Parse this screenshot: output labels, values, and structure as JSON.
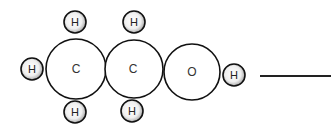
{
  "diagram": {
    "molecule": "ethanol space-filling model",
    "atoms": [
      {
        "id": "h-left",
        "element": "H",
        "label": "H"
      },
      {
        "id": "c1",
        "element": "C",
        "label": "C"
      },
      {
        "id": "c2",
        "element": "C",
        "label": "C"
      },
      {
        "id": "o",
        "element": "O",
        "label": "O"
      },
      {
        "id": "h-right",
        "element": "H",
        "label": "H"
      },
      {
        "id": "h-top-1",
        "element": "H",
        "label": "H"
      },
      {
        "id": "h-top-2",
        "element": "H",
        "label": "H"
      },
      {
        "id": "h-bottom-1",
        "element": "H",
        "label": "H"
      },
      {
        "id": "h-bottom-2",
        "element": "H",
        "label": "H"
      }
    ],
    "colors": {
      "outline": "#111111",
      "hydrogen_fill": "#d9d9d9",
      "heavy_atom_fill": "#ffffff"
    }
  }
}
